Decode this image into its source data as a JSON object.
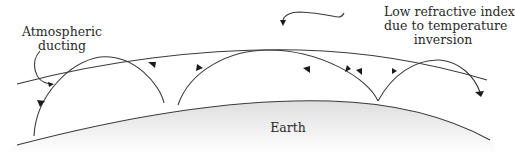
{
  "diagram": {
    "labels": {
      "ducting": [
        "Atmospheric",
        "ducting"
      ],
      "low_index": [
        "Low refractive index",
        "due to temperature",
        "inversion"
      ],
      "earth": "Earth"
    },
    "ray_hops": 4,
    "colors": {
      "line": "#3a3a3a",
      "arrow": "#1a1a1a",
      "earth_fill_top": "#e2e2e2",
      "earth_fill_bottom": "#ffffff"
    }
  }
}
